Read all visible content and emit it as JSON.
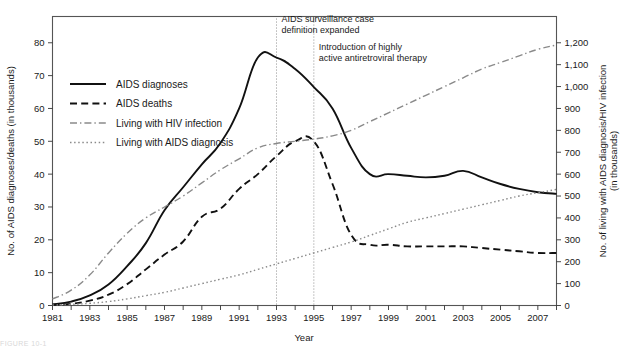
{
  "figure": {
    "caption_partial": "FIGURE 10-1"
  },
  "axes": {
    "x": {
      "label": "Year",
      "ticks": [
        1981,
        1982,
        1983,
        1984,
        1985,
        1986,
        1987,
        1988,
        1989,
        1990,
        1991,
        1992,
        1993,
        1994,
        1995,
        1996,
        1997,
        1998,
        1999,
        2000,
        2001,
        2002,
        2003,
        2004,
        2005,
        2006,
        2007,
        2008
      ],
      "tick_labels": [
        "1981",
        "",
        "1983",
        "",
        "1985",
        "",
        "1987",
        "",
        "1989",
        "",
        "1991",
        "",
        "1993",
        "",
        "1995",
        "",
        "1997",
        "",
        "1999",
        "",
        "2001",
        "",
        "2003",
        "",
        "2005",
        "",
        "2007",
        ""
      ],
      "range": [
        1981,
        2008
      ]
    },
    "y_left": {
      "label": "No. of AIDS diagnoses/deaths (in thousands)",
      "ticks": [
        0,
        10,
        20,
        30,
        40,
        50,
        60,
        70,
        80
      ],
      "tick_labels": [
        "0",
        "10",
        "20",
        "30",
        "40",
        "50",
        "60",
        "70",
        "80"
      ],
      "range": [
        0,
        88
      ]
    },
    "y_right": {
      "label": "No. of living with AIDS diagnosis/HIV infection",
      "label_line2": "(in thousands)",
      "ticks": [
        0,
        100,
        200,
        300,
        400,
        500,
        600,
        700,
        800,
        900,
        1000,
        1100,
        1200
      ],
      "tick_labels": [
        "0",
        "100",
        "200",
        "300",
        "400",
        "500",
        "600",
        "700",
        "800",
        "900",
        "1,000",
        "1,100",
        "1,200"
      ],
      "range": [
        0,
        1320
      ]
    }
  },
  "legend": {
    "items": [
      {
        "label": "AIDS diagnoses",
        "style": "solid",
        "color": "#111111"
      },
      {
        "label": "AIDS deaths",
        "style": "dashed",
        "color": "#111111"
      },
      {
        "label": "Living with HIV infection",
        "style": "dashdot",
        "color": "#8a8a8a"
      },
      {
        "label": "Living with AIDS diagnosis",
        "style": "dotted",
        "color": "#8a8a8a"
      }
    ]
  },
  "annotations": [
    {
      "year": 1993,
      "line1": "AIDS surveillance case",
      "line2": "definition expanded"
    },
    {
      "year": 1995,
      "line1": "Introduction of highly",
      "line2": "active antiretroviral therapy"
    }
  ],
  "chart_data": {
    "type": "line",
    "title": "",
    "xlabel": "Year",
    "ylabel": "No. of AIDS diagnoses/deaths (in thousands)",
    "ylabel_right": "No. of living with AIDS diagnosis/HIV infection (in thousands)",
    "xlim": [
      1981,
      2008
    ],
    "ylim": [
      0,
      88
    ],
    "ylim_right": [
      0,
      1320
    ],
    "grid": false,
    "legend_position": "upper-left",
    "x": [
      1981,
      1982,
      1983,
      1984,
      1985,
      1986,
      1987,
      1988,
      1989,
      1990,
      1991,
      1992,
      1993,
      1994,
      1995,
      1996,
      1997,
      1998,
      1999,
      2000,
      2001,
      2002,
      2003,
      2004,
      2005,
      2006,
      2007,
      2008
    ],
    "series": [
      {
        "name": "AIDS diagnoses",
        "axis": "left",
        "units": "thousands",
        "values": [
          0.3,
          1.2,
          3.1,
          6.4,
          12.0,
          19.0,
          29.0,
          36.0,
          43.0,
          49.5,
          60.0,
          75.5,
          75.5,
          72.0,
          66.5,
          60.0,
          48.0,
          40.0,
          40.0,
          39.5,
          39.0,
          39.5,
          41.0,
          39.0,
          37.0,
          35.5,
          34.5,
          34.0
        ]
      },
      {
        "name": "AIDS deaths",
        "axis": "left",
        "units": "thousands",
        "values": [
          0.2,
          0.5,
          1.5,
          3.3,
          6.5,
          11.0,
          15.5,
          19.5,
          27.0,
          29.5,
          35.5,
          40.0,
          45.5,
          50.0,
          50.0,
          37.0,
          21.5,
          18.5,
          18.5,
          18.0,
          18.0,
          18.0,
          18.0,
          17.5,
          17.0,
          16.5,
          16.0,
          16.0
        ]
      },
      {
        "name": "Living with HIV infection",
        "axis": "right",
        "units": "thousands",
        "values": [
          30,
          70,
          140,
          240,
          330,
          400,
          450,
          500,
          560,
          620,
          670,
          720,
          740,
          750,
          760,
          775,
          800,
          840,
          880,
          920,
          960,
          1000,
          1040,
          1080,
          1110,
          1140,
          1170,
          1190
        ]
      },
      {
        "name": "Living with AIDS diagnosis",
        "axis": "right",
        "units": "thousands",
        "values": [
          2,
          5,
          10,
          18,
          30,
          45,
          60,
          80,
          100,
          120,
          140,
          165,
          190,
          215,
          240,
          265,
          290,
          320,
          350,
          380,
          400,
          420,
          440,
          460,
          480,
          500,
          515,
          530
        ]
      }
    ]
  }
}
